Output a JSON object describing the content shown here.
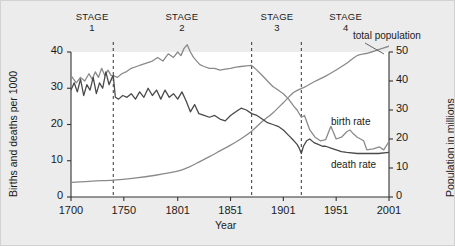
{
  "figure": {
    "background_color": "#ececec",
    "plot_background_color": "#ffffff"
  },
  "stages": [
    {
      "name": "stage-1",
      "title": "STAGE",
      "number": "1",
      "center_year": 1720,
      "start_year": 1700,
      "end_year": 1740
    },
    {
      "name": "stage-2",
      "title": "STAGE",
      "number": "2",
      "center_year": 1805,
      "start_year": 1740,
      "end_year": 1871
    },
    {
      "name": "stage-3",
      "title": "STAGE",
      "number": "3",
      "center_year": 1895,
      "start_year": 1871,
      "end_year": 1918
    },
    {
      "name": "stage-4",
      "title": "STAGE",
      "number": "4",
      "center_year": 1960,
      "start_year": 1918,
      "end_year": 2001
    }
  ],
  "stage_dividers": [
    1740,
    1871,
    1918
  ],
  "curve_labels": {
    "total_population": "total population",
    "birth_rate": "birth rate",
    "death_rate": "death rate"
  },
  "chart_data": {
    "type": "line",
    "title": "",
    "xlabel": "Year",
    "ylabel": "Births and deaths per 1000",
    "y2label": "Population in millions",
    "xlim": [
      1700,
      2001
    ],
    "ylim": [
      0,
      40
    ],
    "y2lim": [
      0,
      50
    ],
    "grid": false,
    "legend": "inline-annotations",
    "xticks": [
      1700,
      1750,
      1801,
      1851,
      1901,
      1951,
      2001
    ],
    "xtick_labels": [
      "1700",
      "1750",
      "1801",
      "1851",
      "1901",
      "1951",
      "2001"
    ],
    "yticks": [
      0,
      10,
      20,
      30,
      40
    ],
    "ytick_labels": [
      "0",
      "10",
      "20",
      "30",
      "40"
    ],
    "y2ticks": [
      0,
      10,
      20,
      30,
      40,
      50
    ],
    "y2tick_labels": [
      "0",
      "10",
      "20",
      "30",
      "40",
      "50"
    ],
    "series": [
      {
        "name": "birth rate",
        "axis": "left",
        "color": "#8a8a8a",
        "units": "per 1000",
        "x": [
          1700,
          1705,
          1709,
          1713,
          1717,
          1720,
          1723,
          1726,
          1729,
          1732,
          1735,
          1738,
          1740,
          1744,
          1748,
          1752,
          1757,
          1762,
          1767,
          1772,
          1777,
          1782,
          1787,
          1792,
          1797,
          1801,
          1804,
          1807,
          1810,
          1813,
          1816,
          1819,
          1822,
          1826,
          1831,
          1836,
          1841,
          1846,
          1851,
          1856,
          1861,
          1866,
          1871,
          1876,
          1881,
          1886,
          1891,
          1896,
          1901,
          1906,
          1911,
          1914,
          1918,
          1921,
          1926,
          1931,
          1936,
          1941,
          1946,
          1951,
          1956,
          1961,
          1964,
          1967,
          1971,
          1974,
          1977,
          1980,
          1986,
          1992,
          1996,
          2001
        ],
        "y": [
          33.5,
          31.5,
          33.0,
          32.0,
          34.0,
          32.5,
          34.5,
          33.0,
          35.5,
          33.5,
          35.0,
          33.5,
          33.5,
          33.0,
          34.0,
          34.5,
          35.5,
          36.0,
          36.5,
          37.0,
          37.5,
          38.5,
          37.5,
          39.5,
          38.5,
          40.0,
          39.0,
          41.0,
          42.0,
          40.0,
          38.5,
          37.5,
          36.5,
          36.0,
          35.5,
          35.5,
          35.0,
          35.3,
          35.5,
          35.8,
          36.0,
          36.2,
          36.3,
          35.0,
          33.5,
          32.0,
          30.5,
          29.5,
          28.5,
          27.0,
          25.0,
          24.0,
          22.0,
          22.5,
          18.5,
          16.5,
          15.5,
          15.8,
          19.5,
          16.0,
          16.5,
          18.0,
          18.5,
          17.5,
          16.5,
          16.0,
          15.5,
          13.0,
          13.3,
          13.8,
          13.0,
          15.3
        ]
      },
      {
        "name": "death rate",
        "axis": "left",
        "color": "#4a4a4a",
        "units": "per 1000",
        "x": [
          1700,
          1703,
          1706,
          1709,
          1712,
          1715,
          1718,
          1721,
          1724,
          1727,
          1730,
          1733,
          1736,
          1739,
          1740,
          1742,
          1745,
          1749,
          1753,
          1757,
          1761,
          1765,
          1769,
          1773,
          1777,
          1781,
          1785,
          1789,
          1793,
          1797,
          1801,
          1805,
          1809,
          1813,
          1817,
          1821,
          1826,
          1831,
          1836,
          1841,
          1846,
          1851,
          1856,
          1861,
          1866,
          1871,
          1876,
          1881,
          1886,
          1891,
          1896,
          1901,
          1906,
          1911,
          1914,
          1916,
          1918,
          1920,
          1923,
          1926,
          1930,
          1934,
          1938,
          1941,
          1946,
          1951,
          1956,
          1961,
          1971,
          1981,
          1991,
          2001
        ],
        "y": [
          29.5,
          31.5,
          29.0,
          32.5,
          28.0,
          31.0,
          29.5,
          33.0,
          28.5,
          31.5,
          30.0,
          34.5,
          31.0,
          33.0,
          33.5,
          27.5,
          27.0,
          28.0,
          27.5,
          28.5,
          27.0,
          29.0,
          27.5,
          30.0,
          28.0,
          29.5,
          27.0,
          29.5,
          27.5,
          28.5,
          27.0,
          29.0,
          26.5,
          23.5,
          25.5,
          23.0,
          22.5,
          22.0,
          22.5,
          21.5,
          21.0,
          22.5,
          23.5,
          24.5,
          24.0,
          23.0,
          22.5,
          21.5,
          20.5,
          20.0,
          19.5,
          18.5,
          17.0,
          15.5,
          14.5,
          13.5,
          12.0,
          14.0,
          15.5,
          16.0,
          15.0,
          14.5,
          14.0,
          14.0,
          13.5,
          13.0,
          12.5,
          12.3,
          12.0,
          12.0,
          12.0,
          12.3
        ]
      },
      {
        "name": "total population",
        "axis": "right",
        "color": "#8a8a8a",
        "units": "millions",
        "x": [
          1700,
          1720,
          1740,
          1760,
          1780,
          1801,
          1811,
          1821,
          1831,
          1841,
          1851,
          1861,
          1871,
          1881,
          1891,
          1901,
          1911,
          1921,
          1931,
          1941,
          1951,
          1961,
          1971,
          1981,
          1991,
          2001
        ],
        "y": [
          5.0,
          5.5,
          5.8,
          6.5,
          7.5,
          8.9,
          10.2,
          12.0,
          13.9,
          15.9,
          17.9,
          20.1,
          22.7,
          26.0,
          29.0,
          32.5,
          36.1,
          37.9,
          39.9,
          41.7,
          43.8,
          46.1,
          48.8,
          49.6,
          50.8,
          52.0
        ]
      }
    ]
  }
}
